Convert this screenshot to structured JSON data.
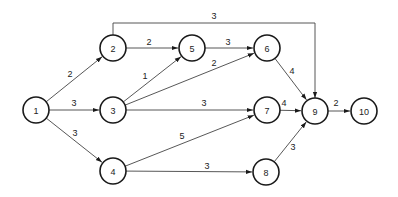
{
  "diagram": {
    "type": "network-activity-on-arrow",
    "node_radius": 13,
    "colors": {
      "stroke": "#1a1a1a",
      "edge": "#444444",
      "background": "#ffffff",
      "text": "#222222"
    },
    "nodes": [
      {
        "id": "1",
        "label": "1",
        "x": 36,
        "y": 110
      },
      {
        "id": "2",
        "label": "2",
        "x": 113,
        "y": 48
      },
      {
        "id": "3",
        "label": "3",
        "x": 113,
        "y": 110
      },
      {
        "id": "4",
        "label": "4",
        "x": 113,
        "y": 171
      },
      {
        "id": "5",
        "label": "5",
        "x": 192,
        "y": 48
      },
      {
        "id": "6",
        "label": "6",
        "x": 267,
        "y": 48
      },
      {
        "id": "7",
        "label": "7",
        "x": 267,
        "y": 110
      },
      {
        "id": "8",
        "label": "8",
        "x": 266,
        "y": 172
      },
      {
        "id": "9",
        "label": "9",
        "x": 315,
        "y": 111
      },
      {
        "id": "10",
        "label": "10",
        "x": 364,
        "y": 111
      }
    ],
    "edges": [
      {
        "from": "1",
        "to": "2",
        "label": "2",
        "lx": 70,
        "ly": 77
      },
      {
        "from": "1",
        "to": "3",
        "label": "3",
        "lx": 74,
        "ly": 106
      },
      {
        "from": "1",
        "to": "4",
        "label": "3",
        "lx": 75,
        "ly": 136
      },
      {
        "from": "2",
        "to": "5",
        "label": "2",
        "lx": 149,
        "ly": 45
      },
      {
        "from": "2",
        "to": "9",
        "label": "3",
        "lx": 214,
        "ly": 19,
        "route": [
          [
            113,
            35
          ],
          [
            113,
            23
          ],
          [
            315,
            23
          ],
          [
            315,
            98
          ]
        ]
      },
      {
        "from": "3",
        "to": "5",
        "label": "1",
        "lx": 145,
        "ly": 79
      },
      {
        "from": "3",
        "to": "6",
        "label": "2",
        "lx": 214,
        "ly": 66
      },
      {
        "from": "3",
        "to": "7",
        "label": "3",
        "lx": 204,
        "ly": 106
      },
      {
        "from": "4",
        "to": "7",
        "label": "5",
        "lx": 182,
        "ly": 139
      },
      {
        "from": "4",
        "to": "8",
        "label": "3",
        "lx": 207,
        "ly": 169
      },
      {
        "from": "5",
        "to": "6",
        "label": "3",
        "lx": 228,
        "ly": 45
      },
      {
        "from": "6",
        "to": "9",
        "label": "4",
        "lx": 292,
        "ly": 74
      },
      {
        "from": "7",
        "to": "9",
        "label": "4",
        "lx": 284,
        "ly": 106
      },
      {
        "from": "8",
        "to": "9",
        "label": "3",
        "lx": 293,
        "ly": 150
      },
      {
        "from": "9",
        "to": "10",
        "label": "2",
        "lx": 336,
        "ly": 106
      }
    ]
  }
}
